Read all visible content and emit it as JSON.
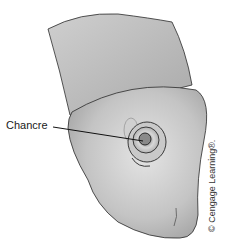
{
  "figure": {
    "labels": [
      {
        "text": "Chancre",
        "target": "lesion"
      }
    ],
    "credit": "© Cengage Learning®.",
    "colors": {
      "skin_light": "#d9d9d9",
      "skin_mid": "#b8b8b8",
      "skin_dark": "#8f8f8f",
      "outline": "#2a2a2a",
      "background": "#ffffff"
    }
  }
}
